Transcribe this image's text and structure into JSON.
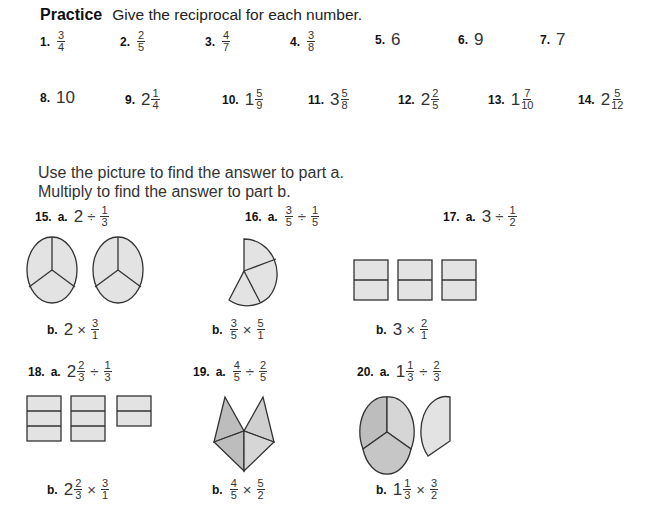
{
  "header": {
    "title": "Practice",
    "instruction": "Give the reciprocal for each number."
  },
  "reciprocal_items": [
    {
      "num": "1.",
      "whole": "",
      "n": "3",
      "d": "4"
    },
    {
      "num": "2.",
      "whole": "",
      "n": "2",
      "d": "5"
    },
    {
      "num": "3.",
      "whole": "",
      "n": "4",
      "d": "7"
    },
    {
      "num": "4.",
      "whole": "",
      "n": "3",
      "d": "8"
    },
    {
      "num": "5.",
      "whole": "6"
    },
    {
      "num": "6.",
      "whole": "9"
    },
    {
      "num": "7.",
      "whole": "7"
    },
    {
      "num": "8.",
      "whole": "10"
    },
    {
      "num": "9.",
      "whole": "2",
      "n": "1",
      "d": "4"
    },
    {
      "num": "10.",
      "whole": "1",
      "n": "5",
      "d": "9"
    },
    {
      "num": "11.",
      "whole": "3",
      "n": "5",
      "d": "8"
    },
    {
      "num": "12.",
      "whole": "2",
      "n": "2",
      "d": "5"
    },
    {
      "num": "13.",
      "whole": "1",
      "n": "7",
      "d": "10"
    },
    {
      "num": "14.",
      "whole": "2",
      "n": "5",
      "d": "12"
    }
  ],
  "directions": {
    "line1": "Use the picture to find the answer to part a.",
    "line2": "Multiply to find the answer to part b."
  },
  "problems": [
    {
      "num": "15.",
      "a_label": "a.",
      "b_label": "b.",
      "a": {
        "left_whole": "2",
        "left_n": "",
        "left_d": "",
        "op": "÷",
        "right_n": "1",
        "right_d": "3"
      },
      "b": {
        "left_whole": "2",
        "left_n": "",
        "left_d": "",
        "op": "×",
        "right_n": "3",
        "right_d": "1"
      },
      "picture": "two-circles-thirds"
    },
    {
      "num": "16.",
      "a_label": "a.",
      "b_label": "b.",
      "a": {
        "left_whole": "",
        "left_n": "3",
        "left_d": "5",
        "op": "÷",
        "right_n": "1",
        "right_d": "5"
      },
      "b": {
        "left_whole": "",
        "left_n": "3",
        "left_d": "5",
        "op": "×",
        "right_n": "5",
        "right_d": "1"
      },
      "picture": "three-fifths-circle"
    },
    {
      "num": "17.",
      "a_label": "a.",
      "b_label": "b.",
      "a": {
        "left_whole": "3",
        "left_n": "",
        "left_d": "",
        "op": "÷",
        "right_n": "1",
        "right_d": "2"
      },
      "b": {
        "left_whole": "3",
        "left_n": "",
        "left_d": "",
        "op": "×",
        "right_n": "2",
        "right_d": "1"
      },
      "picture": "three-squares-halves"
    },
    {
      "num": "18.",
      "a_label": "a.",
      "b_label": "b.",
      "a": {
        "left_whole": "2",
        "left_n": "2",
        "left_d": "3",
        "op": "÷",
        "right_n": "1",
        "right_d": "3"
      },
      "b": {
        "left_whole": "2",
        "left_n": "2",
        "left_d": "3",
        "op": "×",
        "right_n": "3",
        "right_d": "1"
      },
      "picture": "rectangles-thirds"
    },
    {
      "num": "19.",
      "a_label": "a.",
      "b_label": "b.",
      "a": {
        "left_whole": "",
        "left_n": "4",
        "left_d": "5",
        "op": "÷",
        "right_n": "2",
        "right_d": "5"
      },
      "b": {
        "left_whole": "",
        "left_n": "4",
        "left_d": "5",
        "op": "×",
        "right_n": "5",
        "right_d": "2"
      },
      "picture": "four-fifths-pentagon"
    },
    {
      "num": "20.",
      "a_label": "a.",
      "b_label": "b.",
      "a": {
        "left_whole": "1",
        "left_n": "1",
        "left_d": "3",
        "op": "÷",
        "right_n": "2",
        "right_d": "3"
      },
      "b": {
        "left_whole": "1",
        "left_n": "1",
        "left_d": "3",
        "op": "×",
        "right_n": "3",
        "right_d": "2"
      },
      "picture": "circle-and-third"
    }
  ],
  "colors": {
    "light_fill": "#e3e3e3",
    "dark_fill": "#bdbdbd",
    "stroke": "#333333"
  }
}
